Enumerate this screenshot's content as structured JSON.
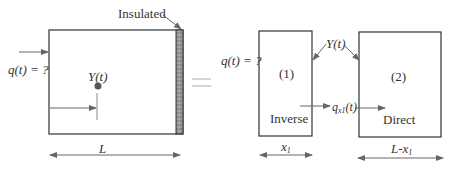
{
  "diagram": {
    "left_panel": {
      "insulated_label": "Insulated",
      "flux_label": "q(t) = ?",
      "sensor_label": "Y(t)",
      "length_label": "L"
    },
    "equals_sign": "=",
    "right_panel": {
      "flux_label": "q(t) = ?",
      "sensor_label": "Y(t)",
      "region1": {
        "number": "(1)",
        "name": "Inverse",
        "width_label_base": "x",
        "width_label_sub": "1"
      },
      "region2": {
        "number": "(2)",
        "name": "Direct",
        "width_label_base": "L-x",
        "width_label_sub": "1"
      },
      "interface_flux_base": "q",
      "interface_flux_sub": "x1",
      "interface_flux_arg": "(t)"
    },
    "colors": {
      "line": "#333333",
      "arrow": "#666666",
      "insulation": "#888888",
      "sensor_dot": "#555555"
    }
  }
}
